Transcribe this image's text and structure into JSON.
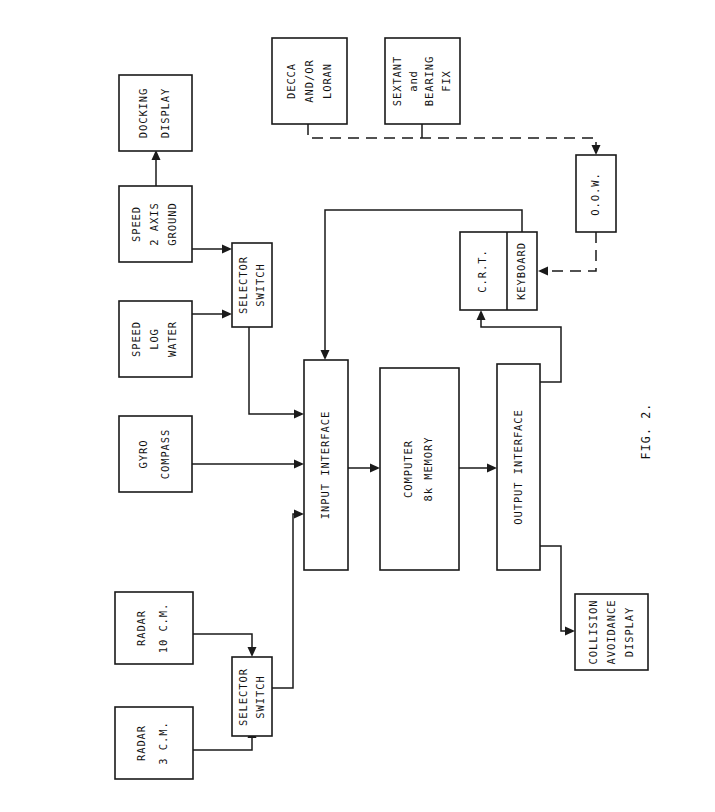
{
  "figure": {
    "caption": "FIG. 2.",
    "page_size": {
      "width": 715,
      "height": 812
    },
    "orientation": "landscape-rotated-90ccw",
    "line_color": "#1a1a1a",
    "background_color": "#ffffff"
  },
  "blocks": {
    "docking_display": {
      "lines": [
        "DOCKING",
        "DISPLAY"
      ]
    },
    "speed_2_axis_ground": {
      "lines": [
        "SPEED",
        "2 AXIS",
        "GROUND"
      ]
    },
    "speed_log_water": {
      "lines": [
        "SPEED",
        "LOG",
        "WATER"
      ]
    },
    "gyro_compass": {
      "lines": [
        "GYRO",
        "COMPASS"
      ]
    },
    "selector_switch_top": {
      "lines": [
        "SELECTOR",
        "SWITCH"
      ]
    },
    "decca_and_or_loran": {
      "lines": [
        "DECCA",
        "AND/OR",
        "LORAN"
      ]
    },
    "sextant_and_bearing_fix": {
      "lines": [
        "SEXTANT",
        "and",
        "BEARING",
        "FIX"
      ]
    },
    "oow": {
      "lines": [
        "O.O.W."
      ]
    },
    "crt": {
      "lines": [
        "C.R.T."
      ]
    },
    "keyboard": {
      "lines": [
        "KEYBOARD"
      ]
    },
    "input_interface": {
      "lines": [
        "INPUT INTERFACE"
      ]
    },
    "computer": {
      "lines": [
        "COMPUTER",
        "8k  MEMORY"
      ]
    },
    "output_interface": {
      "lines": [
        "OUTPUT INTERFACE"
      ]
    },
    "collision_avoidance_display": {
      "lines": [
        "COLLISION",
        "AVOIDANCE",
        "DISPLAY"
      ]
    },
    "radar_10_cm": {
      "lines": [
        "RADAR",
        "10 C.M."
      ]
    },
    "radar_3_cm": {
      "lines": [
        "RADAR",
        "3 C.M."
      ]
    },
    "selector_switch_bottom": {
      "lines": [
        "SELECTOR",
        "SWITCH"
      ]
    }
  },
  "connections": [
    {
      "from": "speed_2_axis_ground",
      "to": "docking_display",
      "style": "solid"
    },
    {
      "from": "speed_2_axis_ground",
      "to": "selector_switch_top",
      "style": "solid"
    },
    {
      "from": "speed_log_water",
      "to": "selector_switch_top",
      "style": "solid"
    },
    {
      "from": "selector_switch_top",
      "to": "input_interface",
      "style": "solid"
    },
    {
      "from": "gyro_compass",
      "to": "input_interface",
      "style": "solid"
    },
    {
      "from": "decca_and_or_loran",
      "to": "oow",
      "style": "dashed"
    },
    {
      "from": "sextant_and_bearing_fix",
      "to": "oow",
      "style": "dashed"
    },
    {
      "from": "oow",
      "to": "keyboard",
      "style": "dashed"
    },
    {
      "from": "keyboard",
      "to": "input_interface",
      "style": "solid"
    },
    {
      "from": "input_interface",
      "to": "computer",
      "style": "solid"
    },
    {
      "from": "computer",
      "to": "output_interface",
      "style": "solid"
    },
    {
      "from": "output_interface",
      "to": "crt",
      "style": "solid"
    },
    {
      "from": "output_interface",
      "to": "collision_avoidance_display",
      "style": "solid"
    },
    {
      "from": "radar_10_cm",
      "to": "selector_switch_bottom",
      "style": "solid"
    },
    {
      "from": "radar_3_cm",
      "to": "selector_switch_bottom",
      "style": "solid"
    },
    {
      "from": "selector_switch_bottom",
      "to": "input_interface",
      "style": "solid"
    }
  ]
}
